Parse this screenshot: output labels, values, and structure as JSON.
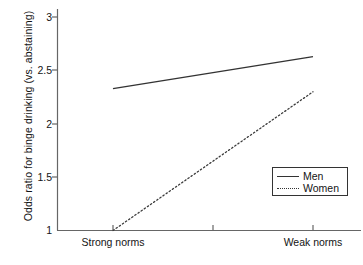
{
  "chart_data": {
    "type": "line",
    "title": "",
    "xlabel": "",
    "ylabel": "Odds ratio for binge drinking (vs. abstaining)",
    "categories": [
      "Strong norms",
      "",
      "Weak norms"
    ],
    "x": [
      0,
      1,
      2
    ],
    "xtick_labels": [
      "Strong norms",
      "",
      "Weak norms"
    ],
    "ytick_labels": [
      "1",
      "1.5",
      "2",
      "2.5",
      "3"
    ],
    "ytick_values": [
      1,
      1.5,
      2,
      2.5,
      3
    ],
    "ylim": [
      1,
      3.05
    ],
    "xlim": [
      -0.55,
      2.27
    ],
    "grid": false,
    "legend_position": "lower right",
    "series": [
      {
        "name": "Men",
        "style": "solid",
        "color": "#333333",
        "x": [
          0,
          2
        ],
        "values": [
          2.33,
          2.63
        ]
      },
      {
        "name": "Women",
        "style": "dotted",
        "color": "#333333",
        "x": [
          0,
          2
        ],
        "values": [
          1.0,
          2.3
        ]
      }
    ],
    "legend": [
      "Men",
      "Women"
    ]
  },
  "axis": {
    "y_title": "Odds ratio for binge drinking (vs. abstaining)",
    "y_ticks": [
      "3",
      "2.5",
      "2",
      "1.5",
      "1"
    ],
    "x_ticks": [
      "Strong norms",
      "Weak norms"
    ]
  },
  "legend": {
    "entries": [
      {
        "label": "Men",
        "style": "solid"
      },
      {
        "label": "Women",
        "style": "dotted"
      }
    ]
  },
  "colors": {
    "line": "#333333",
    "axis": "#555555",
    "text": "#141414",
    "background": "#ffffff"
  }
}
